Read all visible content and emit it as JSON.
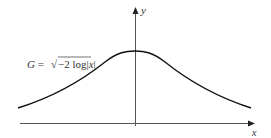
{
  "figure": {
    "equation_label": "G = √−2 log|x|",
    "equation_parts": {
      "lhs": "G = ",
      "radical": "√",
      "radicand": "−2 log|x|"
    },
    "x_axis_label": "x",
    "y_axis_label": "y"
  },
  "colors": {
    "curve": "#111111",
    "axis": "#555555",
    "text": "#333333",
    "background": "#ffffff"
  }
}
